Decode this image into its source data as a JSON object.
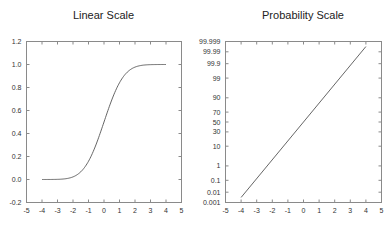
{
  "chart_data": [
    {
      "type": "line",
      "title": "Linear Scale",
      "xlabel": "",
      "ylabel": "",
      "xlim": [
        -5,
        5
      ],
      "ylim": [
        -0.2,
        1.2
      ],
      "grid": false,
      "legend": null,
      "x_ticks": [
        "-5",
        "-4",
        "-3",
        "-2",
        "-1",
        "0",
        "1",
        "2",
        "3",
        "4",
        "5"
      ],
      "y_ticks": [
        "-0.2",
        "0.0",
        "0.2",
        "0.4",
        "0.6",
        "0.8",
        "1.0",
        "1.2"
      ],
      "series": [
        {
          "name": "Normal CDF",
          "x": [
            -4,
            -3,
            -2.5,
            -2,
            -1.5,
            -1,
            -0.5,
            0,
            0.5,
            1,
            1.5,
            2,
            2.5,
            3,
            4
          ],
          "y": [
            0.0,
            0.0013,
            0.0062,
            0.0228,
            0.0668,
            0.1587,
            0.3085,
            0.5,
            0.6915,
            0.8413,
            0.9332,
            0.9772,
            0.9938,
            0.9987,
            1.0
          ]
        }
      ]
    },
    {
      "type": "line",
      "title": "Probability Scale",
      "xlabel": "",
      "ylabel": "",
      "xlim": [
        -5,
        5
      ],
      "ylim": [
        0.001,
        99.999
      ],
      "yscale": "probability",
      "grid": false,
      "legend": null,
      "x_ticks": [
        "-5",
        "-4",
        "-3",
        "-2",
        "-1",
        "0",
        "1",
        "2",
        "3",
        "4",
        "5"
      ],
      "y_ticks": [
        "0.001",
        "0.01",
        "0.1",
        "1",
        "10",
        "30",
        "50",
        "70",
        "90",
        "99",
        "99.9",
        "99.99",
        "99.999"
      ],
      "series": [
        {
          "name": "Normal CDF (%)",
          "x": [
            -4,
            4
          ],
          "y": [
            0.0032,
            99.9968
          ]
        }
      ]
    }
  ],
  "left": {
    "title": "Linear Scale",
    "xticks": [
      "-5",
      "-4",
      "-3",
      "-2",
      "-1",
      "0",
      "1",
      "2",
      "3",
      "4",
      "5"
    ],
    "yticks": [
      "1.2",
      "1.0",
      "0.8",
      "0.6",
      "0.4",
      "0.2",
      "0.0",
      "-0.2"
    ]
  },
  "right": {
    "title": "Probability Scale",
    "xticks": [
      "-5",
      "-4",
      "-3",
      "-2",
      "-1",
      "0",
      "1",
      "2",
      "3",
      "4",
      "5"
    ],
    "yticks": [
      "99.999",
      "99.99",
      "99.9",
      "99",
      "90",
      "70",
      "50",
      "30",
      "10",
      "1",
      "0.1",
      "0.01",
      "0.001"
    ]
  }
}
